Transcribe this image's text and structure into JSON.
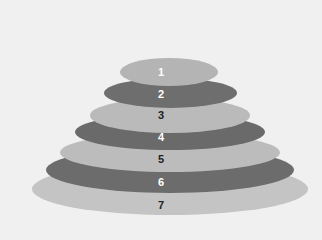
{
  "diagram": {
    "type": "stacked-ellipse-pyramid",
    "background": "#f0f0f0",
    "layers": [
      {
        "label": "1",
        "x": 120,
        "y": 58,
        "w": 98,
        "h": 28,
        "fill": "#b4b4b4",
        "text_color": "#ffffff",
        "label_y": 66
      },
      {
        "label": "2",
        "x": 104,
        "y": 78,
        "w": 133,
        "h": 30,
        "fill": "#6e6e6e",
        "text_color": "#ffffff",
        "label_y": 88
      },
      {
        "label": "3",
        "x": 90,
        "y": 98,
        "w": 160,
        "h": 35,
        "fill": "#bababa",
        "text_color": "#222222",
        "label_y": 109
      },
      {
        "label": "4",
        "x": 75,
        "y": 114,
        "w": 190,
        "h": 36,
        "fill": "#6a6a6a",
        "text_color": "#ffffff",
        "label_y": 131
      },
      {
        "label": "5",
        "x": 60,
        "y": 133,
        "w": 220,
        "h": 39,
        "fill": "#bcbcbc",
        "text_color": "#222222",
        "label_y": 153
      },
      {
        "label": "6",
        "x": 46,
        "y": 147,
        "w": 248,
        "h": 46,
        "fill": "#6c6c6c",
        "text_color": "#ffffff",
        "label_y": 176
      },
      {
        "label": "7",
        "x": 32,
        "y": 163,
        "w": 276,
        "h": 52,
        "fill": "#c4c4c4",
        "text_color": "#222222",
        "label_y": 199
      }
    ]
  }
}
